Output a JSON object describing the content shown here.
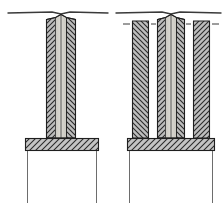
{
  "figure": {
    "title": "Sectional views of two column and base-slab assemblies",
    "domain_note": "technical-line-drawing",
    "canvas": {
      "width": 223,
      "height": 211,
      "background": "#ffffff"
    }
  },
  "style": {
    "ink": "#262626",
    "ink_soft": "#4a4a4a",
    "hatch_line": "#2b2b2b",
    "hatch_field": "#b9b9b9",
    "core_fill": "#cfcdc6",
    "core_fill_light": "#d9d7d0",
    "slab_field": "#c2c2c2",
    "paper": "#ffffff",
    "line_width_main": 1,
    "line_width_thin": 0.7
  },
  "figures": [
    {
      "id": "left-assembly",
      "label": "Left assembly — single column on footing",
      "ground_line": {
        "x1": 8,
        "x2": 108,
        "y": 12
      },
      "apex": {
        "x": 61,
        "y": 13
      },
      "column": {
        "label": "single hollow column",
        "x": 46,
        "y": 18,
        "width": 30,
        "height": 120,
        "wall_thickness": 9,
        "core_label": "light core"
      },
      "slab": {
        "label": "footing slab",
        "x": 25,
        "y": 138,
        "width": 74,
        "height": 13
      },
      "legs": [
        {
          "label": "left extension line",
          "x": 27,
          "y1": 151,
          "y2": 203
        },
        {
          "label": "right extension line",
          "x": 97,
          "y1": 151,
          "y2": 203
        }
      ]
    },
    {
      "id": "right-assembly",
      "label": "Right assembly — triple column group on footing",
      "ground_line": {
        "x1": 116,
        "x2": 221,
        "y": 12
      },
      "apex": {
        "x": 171,
        "y": 13
      },
      "columns": [
        {
          "label": "outer left column",
          "type": "solid-hatched",
          "x": 132,
          "y": 20,
          "width": 17,
          "height": 118
        },
        {
          "label": "centre hollow column",
          "type": "hollow-core",
          "x": 157,
          "y": 18,
          "width": 28,
          "height": 120,
          "wall_thickness": 8,
          "core_label": "light core"
        },
        {
          "label": "outer right column",
          "type": "solid-hatched",
          "x": 193,
          "y": 20,
          "width": 17,
          "height": 118
        }
      ],
      "slab": {
        "label": "footing slab",
        "x": 127,
        "y": 138,
        "width": 88,
        "height": 13
      },
      "legs": [
        {
          "label": "left extension line",
          "x": 129,
          "y1": 151,
          "y2": 203
        },
        {
          "label": "right extension line",
          "x": 213,
          "y1": 151,
          "y2": 203
        }
      ],
      "tick_marks": [
        {
          "label": "dimension tick outer-left-a",
          "x1": 123,
          "x2": 130,
          "y": 24
        },
        {
          "label": "dimension tick outer-left-b",
          "x1": 151,
          "x2": 157,
          "y": 24
        },
        {
          "label": "dimension tick outer-right-a",
          "x1": 186,
          "x2": 192,
          "y": 24
        },
        {
          "label": "dimension tick outer-right-b",
          "x1": 212,
          "x2": 219,
          "y": 24
        }
      ]
    }
  ],
  "annotations": {
    "hatch_angle_left_wall": "45deg ascending",
    "hatch_angle_right_wall": "45deg descending",
    "slab_hatch_angle": "45deg ascending"
  }
}
